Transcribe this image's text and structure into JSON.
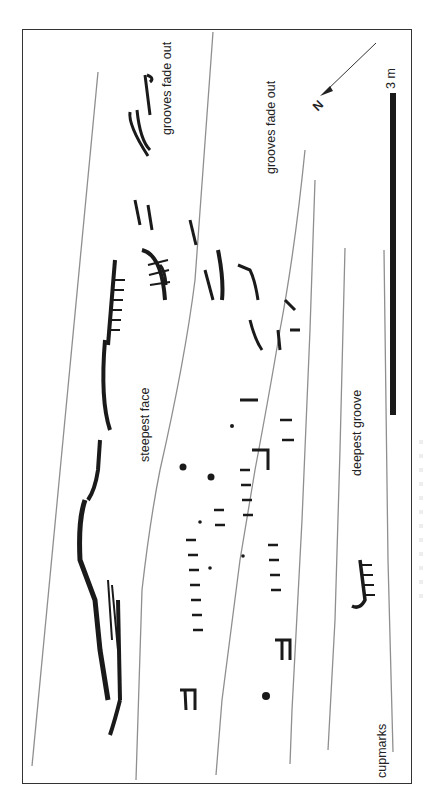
{
  "figure": {
    "type": "rock-art-panel-tracing",
    "orientation": "rotated 90deg counter-clockwise",
    "labels": {
      "grooves_fade_out_1": "grooves fade out",
      "grooves_fade_out_2": "grooves fade out",
      "steepest_face": "steepest face",
      "deepest_groove": "deepest groove",
      "cupmarks": "cupmarks"
    },
    "scale_bar": {
      "label": "3 m",
      "color": "#1a1a1a"
    },
    "north_arrow": {
      "label": "N"
    },
    "colors": {
      "figures": "#1a1a1a",
      "grooves": "#8a8a8a",
      "frame": "#333333",
      "background": "#ffffff"
    }
  }
}
